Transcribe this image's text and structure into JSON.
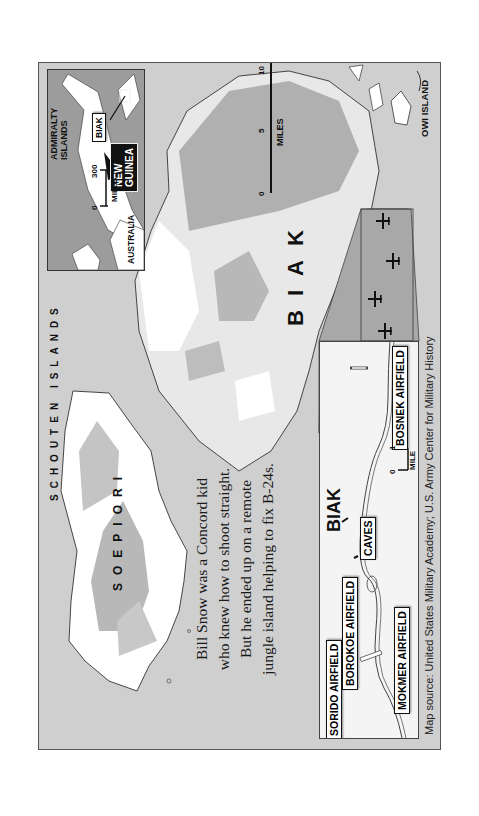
{
  "map": {
    "orientation": "rotated 90 degrees counter-clockwise",
    "labels": {
      "schouten_islands": "SCHOUTEN ISLANDS",
      "soepiori": "SOEPIORI",
      "biak": "BIAK",
      "owi_island": "OWI ISLAND"
    },
    "scale_main": {
      "ticks": [
        "0",
        "5",
        "10"
      ],
      "unit": "MILES"
    },
    "inset": {
      "labels": {
        "admiralty_islands_line1": "ADMIRALTY",
        "admiralty_islands_line2": "ISLANDS",
        "biak": "BIAK",
        "new_guinea_line1": "NEW",
        "new_guinea_line2": "GUINEA",
        "australia": "AUSTRALIA"
      },
      "scale": {
        "ticks": [
          "0",
          "300"
        ],
        "unit": "MILES"
      }
    },
    "detail": {
      "biak": "BIAK",
      "airfields": [
        {
          "name": "SORIDO AIRFIELD"
        },
        {
          "name": "BOROKOE AIRFIELD"
        },
        {
          "name": "MOKMER AIRFIELD"
        },
        {
          "name": "BOSNEK AIRFIELD"
        }
      ],
      "caves": "CAVES",
      "scale": {
        "ticks": [
          "0",
          "1"
        ],
        "unit": "MILE"
      }
    },
    "aircraft_markers": 4
  },
  "pull_quote": {
    "lines": [
      "Bill Snow was a Concord kid",
      "who knew how to shoot straight.",
      "But he ended up on a remote",
      "jungle island helping to fix B-24s."
    ]
  },
  "source": "Map source: United States Military Academy; U.S. Army Center for Military History",
  "colors": {
    "sea": "#cfcfcf",
    "land_low": "#ffffff",
    "land_mid": "#e4e4e4",
    "land_high": "#b4b4b4",
    "inset_sea": "#9c9c9c",
    "outline": "#333333"
  }
}
